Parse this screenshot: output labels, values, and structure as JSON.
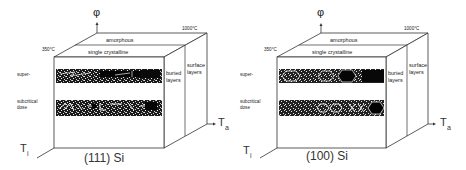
{
  "figure": {
    "panels": [
      {
        "id": "left",
        "caption": "(111) Si",
        "axis_vertical": "φ",
        "axis_right_main": "T",
        "axis_right_sub": "a",
        "axis_left_main": "T",
        "axis_left_sub": "i",
        "temp_low": "350°C",
        "temp_high": "1000°C",
        "top_layer_label": "amorphous",
        "second_layer_label": "single crystalline",
        "row_label_upper": "super-",
        "row_label_lower_1": "subcritical",
        "row_label_lower_2": "dose",
        "side_label_buried_1": "buried",
        "side_label_buried_2": "layers",
        "side_label_surface_1": "surface",
        "side_label_surface_2": "layers",
        "texture": "irregular streaks"
      },
      {
        "id": "right",
        "caption": "(100) Si",
        "axis_vertical": "φ",
        "axis_right_main": "T",
        "axis_right_sub": "a",
        "axis_left_main": "T",
        "axis_left_sub": "i",
        "temp_low": "350°C",
        "temp_high": "1000°C",
        "top_layer_label": "amorphous",
        "second_layer_label": "single crystalline",
        "row_label_upper": "super-",
        "row_label_lower_1": "subcritical",
        "row_label_lower_2": "dose",
        "side_label_buried_1": "buried",
        "side_label_buried_2": "layers",
        "side_label_surface_1": "surface",
        "side_label_surface_2": "layers",
        "texture": "hexagonal cells"
      }
    ]
  }
}
